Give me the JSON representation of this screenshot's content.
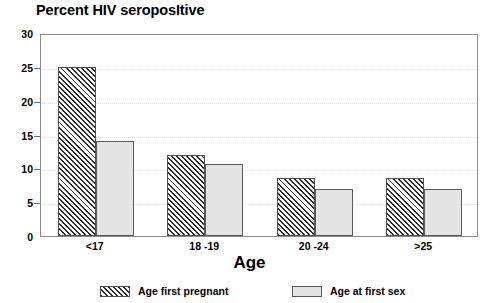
{
  "chart_data": {
    "type": "bar",
    "title": "Percent HIV seroposItive",
    "xlabel": "Age",
    "ylabel": "",
    "categories": [
      "<17",
      "18 -19",
      "20 -24",
      ">25"
    ],
    "series": [
      {
        "name": "Age first pregnant",
        "pattern": "diagonal-hatch",
        "color": "#ffffff",
        "values": [
          25.0,
          12.0,
          8.5,
          8.6
        ]
      },
      {
        "name": "Age at first sex",
        "pattern": "solid",
        "color": "#e4e4e4",
        "values": [
          14.0,
          10.7,
          6.9,
          6.9
        ]
      }
    ],
    "ylim": [
      0,
      30
    ],
    "yticks": [
      0,
      5,
      10,
      15,
      20,
      25,
      30
    ],
    "ytick_labels": [
      "0",
      "5",
      "10",
      "15",
      "20",
      "25",
      "30"
    ],
    "grid": true,
    "grid_style": "dotted",
    "legend_position": "bottom"
  },
  "legend": {
    "items": [
      {
        "label": "Age first pregnant"
      },
      {
        "label": "Age at first sex"
      }
    ]
  }
}
